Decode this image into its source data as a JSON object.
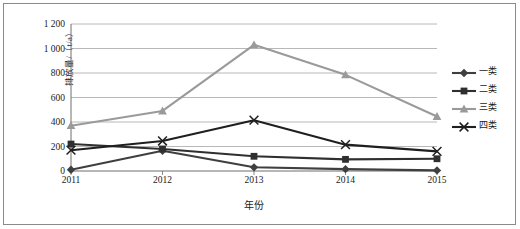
{
  "chart_data": {
    "type": "line",
    "title": "",
    "xlabel": "年份",
    "ylabel": "排放量/（t/a）",
    "categories": [
      "2011",
      "2012",
      "2013",
      "2014",
      "2015"
    ],
    "x": [
      2011,
      2012,
      2013,
      2014,
      2015
    ],
    "ylim": [
      0,
      1200
    ],
    "yticks": [
      0,
      200,
      400,
      600,
      800,
      1000,
      1200
    ],
    "ytick_labels": [
      "0",
      "200",
      "400",
      "600",
      "800",
      "1 000",
      "1 200"
    ],
    "grid": "horizontal",
    "legend_position": "right",
    "series": [
      {
        "name": "一类",
        "values": [
          10,
          165,
          30,
          15,
          5
        ],
        "color": "#3f3f3f",
        "marker": "diamond"
      },
      {
        "name": "二类",
        "values": [
          220,
          180,
          120,
          95,
          100
        ],
        "color": "#2f2f2f",
        "marker": "square"
      },
      {
        "name": "三类",
        "values": [
          370,
          490,
          1030,
          785,
          445
        ],
        "color": "#9a9a9a",
        "marker": "triangle"
      },
      {
        "name": "四类",
        "values": [
          170,
          245,
          415,
          215,
          160
        ],
        "color": "#1f1f1f",
        "marker": "cross"
      }
    ]
  },
  "legend": {
    "items": [
      {
        "label": "一类"
      },
      {
        "label": "二类"
      },
      {
        "label": "三类"
      },
      {
        "label": "四类"
      }
    ]
  },
  "colors": {
    "series_1": "#3f3f3f",
    "series_2": "#2f2f2f",
    "series_3": "#9a9a9a",
    "series_4": "#1f1f1f",
    "gridline": "#a6a6a6",
    "axis": "#6e6e6e",
    "frame": "#8a8a8a",
    "text": "#1a1a1a",
    "background": "#ffffff"
  }
}
